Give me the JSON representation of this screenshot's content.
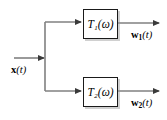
{
  "diagram": {
    "type": "block-diagram",
    "background_color": "#ffffff",
    "wire_color": "#808080",
    "box_border_color": "#1a1a1a",
    "text_color": "#000000",
    "input": {
      "name": "input-signal",
      "label_main": "x",
      "label_arg": "(t)",
      "label_full": "x(t)"
    },
    "blocks": [
      {
        "name": "block-t1",
        "symbol": "T",
        "subscript": "1",
        "argument": "(ω)",
        "label_full": "T₁(ω)"
      },
      {
        "name": "block-t2",
        "symbol": "T",
        "subscript": "2",
        "argument": "(ω)",
        "label_full": "T₂(ω)"
      }
    ],
    "outputs": [
      {
        "name": "output-w1",
        "label_main": "w",
        "subscript": "1",
        "label_arg": "(t)",
        "label_full": "w₁(t)"
      },
      {
        "name": "output-w2",
        "label_main": "w",
        "subscript": "2",
        "label_arg": "(t)",
        "label_full": "w₂(t)"
      }
    ]
  }
}
